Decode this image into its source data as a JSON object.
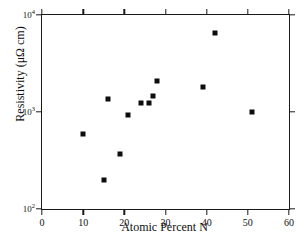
{
  "chart_data": {
    "type": "scatter",
    "title": "",
    "xlabel": "Atomic Percent N",
    "ylabel": "Resistivity (μΩ cm)",
    "xlim": [
      0,
      60
    ],
    "ylim": [
      100,
      10000
    ],
    "yscale": "log",
    "xscale": "linear",
    "grid": false,
    "legend": null,
    "xticks": [
      0,
      10,
      20,
      30,
      40,
      50,
      60
    ],
    "xtick_labels": [
      "0",
      "10",
      "20",
      "30",
      "40",
      "50",
      "60"
    ],
    "yticks": [
      100,
      1000,
      10000
    ],
    "ytick_labels": [
      "10",
      "10",
      "10"
    ],
    "ytick_exponents": [
      "2",
      "3",
      "4"
    ],
    "marker": "filled-square",
    "marker_color": "#0d0d0d",
    "series": [
      {
        "name": "resistivity",
        "points": [
          {
            "x": 10,
            "y": 600
          },
          {
            "x": 15,
            "y": 200
          },
          {
            "x": 16,
            "y": 1350
          },
          {
            "x": 19,
            "y": 370
          },
          {
            "x": 21,
            "y": 940
          },
          {
            "x": 24,
            "y": 1250
          },
          {
            "x": 26,
            "y": 1230
          },
          {
            "x": 27,
            "y": 1450
          },
          {
            "x": 28,
            "y": 2100
          },
          {
            "x": 39,
            "y": 1800
          },
          {
            "x": 42,
            "y": 6500
          },
          {
            "x": 51,
            "y": 990
          }
        ]
      }
    ]
  },
  "figure": {
    "axis_color": "#1a1a1a",
    "background": "#ffffff"
  }
}
